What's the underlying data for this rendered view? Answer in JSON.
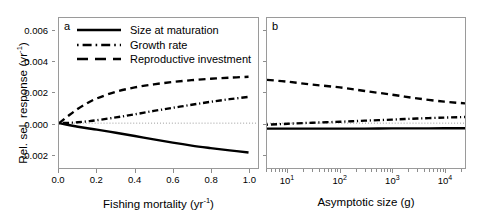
{
  "figure": {
    "ylabel": "Rel. sel. response (yr",
    "ylabel_exp": "-1",
    "ylabel_tail": ")",
    "yticks": [
      "0.006",
      "0.004",
      "0.002",
      "0.000",
      "-0.002"
    ],
    "ytick_values": [
      0.006,
      0.004,
      0.002,
      0.0,
      -0.002
    ],
    "colors": {
      "line": "#000000",
      "axis": "#9a9a9a",
      "zero_line": "#9a9a9a"
    }
  },
  "legend": {
    "items": [
      {
        "label": "Size at maturation",
        "key": "solid-line-key"
      },
      {
        "label": "Growth rate",
        "key": "dash-dot-line-key"
      },
      {
        "label": "Reproductive investment",
        "key": "dashed-line-key"
      }
    ]
  },
  "panel_a": {
    "tag": "a",
    "xlabel": "Fishing mortality (yr",
    "xlabel_exp": "-1",
    "xlabel_tail": ")",
    "xticks": [
      "0.0",
      "0.2",
      "0.4",
      "0.6",
      "0.8",
      "1.0"
    ],
    "xtick_values": [
      0.0,
      0.2,
      0.4,
      0.6,
      0.8,
      1.0
    ]
  },
  "panel_b": {
    "tag": "b",
    "xlabel": "Asymptotic size (g)",
    "xticks": [
      "10",
      "10",
      "10",
      "10"
    ],
    "xtick_exps": [
      "1",
      "2",
      "3",
      "4"
    ],
    "xtick_values": [
      10,
      100,
      1000,
      10000
    ]
  },
  "chart_data": [
    {
      "type": "line",
      "panel": "a",
      "title": "a",
      "xlabel": "Fishing mortality (yr^-1)",
      "ylabel": "Rel. sel. response (yr^-1)",
      "xscale": "linear",
      "xlim": [
        0.0,
        1.05
      ],
      "ylim": [
        -0.0029,
        0.0068
      ],
      "grid": false,
      "zero_reference_line": 0.0,
      "legend_position": "top-left",
      "x": [
        0.0,
        0.05,
        0.1,
        0.15,
        0.2,
        0.3,
        0.4,
        0.5,
        0.6,
        0.7,
        0.8,
        0.9,
        1.0
      ],
      "series": [
        {
          "name": "Size at maturation",
          "style": "solid",
          "values": [
            0.0,
            -0.00012,
            -0.00023,
            -0.00033,
            -0.00042,
            -0.00062,
            -0.00083,
            -0.00105,
            -0.00126,
            -0.00145,
            -0.00161,
            -0.00176,
            -0.0019
          ]
        },
        {
          "name": "Growth rate",
          "style": "dash-dot",
          "values": [
            0.0,
            2e-05,
            6e-05,
            0.00012,
            0.00019,
            0.00037,
            0.00057,
            0.00079,
            0.00099,
            0.00119,
            0.00138,
            0.00155,
            0.0017
          ]
        },
        {
          "name": "Reproductive investment",
          "style": "dashed",
          "values": [
            0.0,
            0.00048,
            0.00093,
            0.0013,
            0.0016,
            0.00203,
            0.00231,
            0.00251,
            0.00266,
            0.00278,
            0.00287,
            0.00294,
            0.003
          ]
        }
      ]
    },
    {
      "type": "line",
      "panel": "b",
      "title": "b",
      "xlabel": "Asymptotic size (g)",
      "ylabel": "Rel. sel. response (yr^-1)",
      "xscale": "log",
      "xlim": [
        4,
        25000
      ],
      "ylim": [
        -0.0029,
        0.0068
      ],
      "grid": false,
      "zero_reference_line": 0.0,
      "x": [
        4,
        10,
        30,
        100,
        300,
        1000,
        3000,
        10000,
        25000
      ],
      "series": [
        {
          "name": "Size at maturation",
          "style": "solid",
          "values": [
            -0.00035,
            -0.00035,
            -0.00035,
            -0.00035,
            -0.00035,
            -0.00034,
            -0.00034,
            -0.00033,
            -0.00033
          ]
        },
        {
          "name": "Growth rate",
          "style": "dash-dot",
          "values": [
            -0.0001,
            -4e-05,
            3e-05,
            9e-05,
            0.00016,
            0.00023,
            0.0003,
            0.00036,
            0.0004
          ]
        },
        {
          "name": "Reproductive investment",
          "style": "dashed",
          "values": [
            0.0028,
            0.00268,
            0.00249,
            0.00231,
            0.00208,
            0.00184,
            0.0016,
            0.00139,
            0.00128
          ]
        }
      ]
    }
  ]
}
